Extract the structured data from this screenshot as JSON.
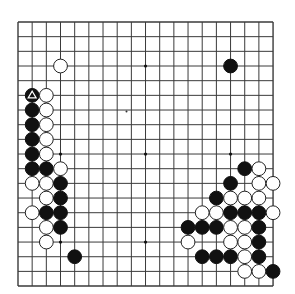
{
  "board": {
    "size": 19,
    "background": "#ffffff",
    "line_color": "#3a3a3a",
    "origin": {
      "x": 18,
      "y": 22
    },
    "spacing": {
      "x": 14.17,
      "y": 14.67
    },
    "stone_radius": 6.9,
    "colors": {
      "black": "#111111",
      "white": "#ffffff",
      "white_outline": "#222222"
    },
    "star_points": [
      [
        3,
        3
      ],
      [
        9,
        3
      ],
      [
        15,
        3
      ],
      [
        3,
        9
      ],
      [
        9,
        9
      ],
      [
        15,
        9
      ],
      [
        3,
        15
      ],
      [
        9,
        15
      ],
      [
        15,
        15
      ]
    ],
    "stray_mark": {
      "x": 126.5,
      "y": 111.5
    },
    "last_move_marker": {
      "col": 1,
      "row": 5,
      "shape": "triangle",
      "color": "#ffffff"
    },
    "stones": [
      {
        "col": 3,
        "row": 3,
        "color": "white"
      },
      {
        "col": 15,
        "row": 3,
        "color": "black"
      },
      {
        "col": 1,
        "row": 5,
        "color": "black"
      },
      {
        "col": 2,
        "row": 5,
        "color": "white"
      },
      {
        "col": 1,
        "row": 6,
        "color": "black"
      },
      {
        "col": 2,
        "row": 6,
        "color": "white"
      },
      {
        "col": 1,
        "row": 7,
        "color": "black"
      },
      {
        "col": 2,
        "row": 7,
        "color": "white"
      },
      {
        "col": 1,
        "row": 8,
        "color": "black"
      },
      {
        "col": 2,
        "row": 8,
        "color": "white"
      },
      {
        "col": 1,
        "row": 9,
        "color": "black"
      },
      {
        "col": 2,
        "row": 9,
        "color": "white"
      },
      {
        "col": 1,
        "row": 10,
        "color": "black"
      },
      {
        "col": 2,
        "row": 10,
        "color": "black"
      },
      {
        "col": 3,
        "row": 10,
        "color": "white"
      },
      {
        "col": 1,
        "row": 11,
        "color": "white"
      },
      {
        "col": 2,
        "row": 11,
        "color": "white"
      },
      {
        "col": 3,
        "row": 11,
        "color": "black"
      },
      {
        "col": 2,
        "row": 12,
        "color": "white"
      },
      {
        "col": 3,
        "row": 12,
        "color": "black"
      },
      {
        "col": 1,
        "row": 13,
        "color": "white"
      },
      {
        "col": 2,
        "row": 13,
        "color": "black"
      },
      {
        "col": 3,
        "row": 13,
        "color": "black"
      },
      {
        "col": 2,
        "row": 14,
        "color": "white"
      },
      {
        "col": 3,
        "row": 14,
        "color": "black"
      },
      {
        "col": 2,
        "row": 15,
        "color": "white"
      },
      {
        "col": 4,
        "row": 16,
        "color": "black"
      },
      {
        "col": 16,
        "row": 10,
        "color": "black"
      },
      {
        "col": 17,
        "row": 10,
        "color": "white"
      },
      {
        "col": 15,
        "row": 11,
        "color": "black"
      },
      {
        "col": 17,
        "row": 11,
        "color": "white"
      },
      {
        "col": 18,
        "row": 11,
        "color": "white"
      },
      {
        "col": 14,
        "row": 12,
        "color": "black"
      },
      {
        "col": 15,
        "row": 12,
        "color": "white"
      },
      {
        "col": 16,
        "row": 12,
        "color": "white"
      },
      {
        "col": 17,
        "row": 12,
        "color": "white"
      },
      {
        "col": 13,
        "row": 13,
        "color": "white"
      },
      {
        "col": 14,
        "row": 13,
        "color": "white"
      },
      {
        "col": 15,
        "row": 13,
        "color": "black"
      },
      {
        "col": 16,
        "row": 13,
        "color": "black"
      },
      {
        "col": 17,
        "row": 13,
        "color": "black"
      },
      {
        "col": 18,
        "row": 13,
        "color": "white"
      },
      {
        "col": 12,
        "row": 14,
        "color": "black"
      },
      {
        "col": 13,
        "row": 14,
        "color": "black"
      },
      {
        "col": 14,
        "row": 14,
        "color": "black"
      },
      {
        "col": 15,
        "row": 14,
        "color": "white"
      },
      {
        "col": 16,
        "row": 14,
        "color": "white"
      },
      {
        "col": 17,
        "row": 14,
        "color": "black"
      },
      {
        "col": 12,
        "row": 15,
        "color": "white"
      },
      {
        "col": 15,
        "row": 15,
        "color": "white"
      },
      {
        "col": 16,
        "row": 15,
        "color": "white"
      },
      {
        "col": 17,
        "row": 15,
        "color": "black"
      },
      {
        "col": 13,
        "row": 16,
        "color": "black"
      },
      {
        "col": 14,
        "row": 16,
        "color": "black"
      },
      {
        "col": 15,
        "row": 16,
        "color": "black"
      },
      {
        "col": 16,
        "row": 16,
        "color": "white"
      },
      {
        "col": 17,
        "row": 16,
        "color": "black"
      },
      {
        "col": 16,
        "row": 17,
        "color": "white"
      },
      {
        "col": 17,
        "row": 17,
        "color": "white"
      },
      {
        "col": 18,
        "row": 17,
        "color": "black"
      }
    ]
  }
}
